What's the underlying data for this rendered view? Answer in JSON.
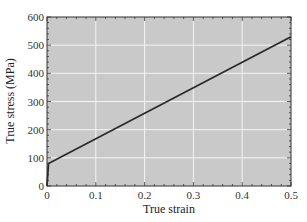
{
  "chart_data": {
    "type": "line",
    "title": "",
    "xlabel": "True strain",
    "ylabel": "True stress (MPa)",
    "xlim": [
      0,
      0.5
    ],
    "ylim": [
      0,
      600
    ],
    "xticks": [
      0,
      0.1,
      0.2,
      0.3,
      0.4,
      0.5
    ],
    "xtick_labels": [
      "0",
      "0.1",
      "0.2",
      "0.3",
      "0.4",
      "0.5"
    ],
    "yticks": [
      0,
      100,
      200,
      300,
      400,
      500,
      600
    ],
    "ytick_labels": [
      "0",
      "100",
      "200",
      "300",
      "400",
      "500",
      "600"
    ],
    "grid": true,
    "legend": null,
    "series": [
      {
        "name": "True stress-strain",
        "x": [
          0,
          0.003,
          0.5
        ],
        "y": [
          0,
          80,
          530
        ]
      }
    ]
  },
  "colors": {
    "plot_background": "#c9c9c9",
    "gridline": "#f4f4f4",
    "line": "#2a2a2a",
    "frame": "#333333"
  }
}
